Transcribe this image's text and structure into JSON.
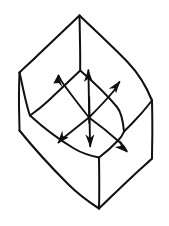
{
  "figure": {
    "background_color": "#ffffff",
    "ink_color": "#101010",
    "canvas": {
      "width": 169,
      "height": 226
    },
    "stroke_style": {
      "weight_main": 2.0,
      "weight_thin": 1.7,
      "cap": "round",
      "join": "round",
      "hand_drawn": true
    },
    "vertices": {
      "top_apex": [
        79,
        15
      ],
      "left_corner": [
        19,
        72
      ],
      "right_corner": [
        152,
        100
      ],
      "bottom_apex": [
        99,
        208
      ],
      "inner_top": [
        80,
        70
      ],
      "inner_left": [
        30,
        115
      ],
      "inner_right": [
        124,
        131
      ],
      "inner_bottom": [
        99,
        157
      ],
      "left_edge_bottom": [
        19,
        130
      ],
      "right_edge_bottom": [
        152,
        158
      ]
    },
    "shapes": [
      {
        "name": "outer-top-left-edge",
        "from": "top_apex",
        "to": "left_corner"
      },
      {
        "name": "outer-top-right-edge",
        "from": "top_apex",
        "to": "right_corner"
      },
      {
        "name": "outer-bottom-left-edge",
        "from": "left_edge_bottom",
        "to": "bottom_apex"
      },
      {
        "name": "outer-bottom-right-edge",
        "from": "bottom_apex",
        "to": "right_edge_bottom"
      },
      {
        "name": "left-vertical-edge",
        "from": "left_corner",
        "to": "left_edge_bottom"
      },
      {
        "name": "right-vertical-edge",
        "from": "right_corner",
        "to": "right_edge_bottom"
      },
      {
        "name": "center-vertical-edge",
        "from": "inner_bottom",
        "to": "bottom_apex"
      },
      {
        "name": "apex-vertical-rib",
        "from": "top_apex",
        "to": "inner_top"
      },
      {
        "name": "inner-rim-upper-left",
        "from": "inner_top",
        "to": "inner_left"
      },
      {
        "name": "inner-rim-upper-right",
        "from": "inner_top",
        "to": "inner_right"
      },
      {
        "name": "inner-rim-lower-left",
        "from": "inner_left",
        "to": "inner_bottom"
      },
      {
        "name": "inner-rim-lower-right",
        "from": "inner_bottom",
        "to": "inner_right"
      },
      {
        "name": "left-wall-fold",
        "from": "left_corner",
        "to": "inner_left"
      },
      {
        "name": "right-wall-fold",
        "from": "right_corner",
        "to": "inner_right"
      }
    ],
    "arrows": {
      "origin": [
        89,
        117
      ],
      "count": 5,
      "items": [
        {
          "name": "arrow-up-left",
          "direction": "up-left",
          "tail": [
            89,
            117
          ],
          "head": [
            59,
            75
          ],
          "angle_deg": 234
        },
        {
          "name": "arrow-up",
          "direction": "up",
          "tail": [
            89,
            122
          ],
          "head": [
            88,
            70
          ],
          "angle_deg": 270
        },
        {
          "name": "arrow-up-right",
          "direction": "up-right",
          "tail": [
            89,
            117
          ],
          "head": [
            119,
            81
          ],
          "angle_deg": 310
        },
        {
          "name": "arrow-down-left",
          "direction": "down-left",
          "tail": [
            89,
            117
          ],
          "head": [
            58,
            143
          ],
          "angle_deg": 140
        },
        {
          "name": "arrow-down",
          "direction": "down",
          "tail": [
            89,
            97
          ],
          "head": [
            90,
            146
          ],
          "angle_deg": 90
        },
        {
          "name": "arrow-down-right",
          "direction": "down-right",
          "tail": [
            89,
            117
          ],
          "head": [
            127,
            152
          ],
          "angle_deg": 42
        }
      ]
    }
  }
}
